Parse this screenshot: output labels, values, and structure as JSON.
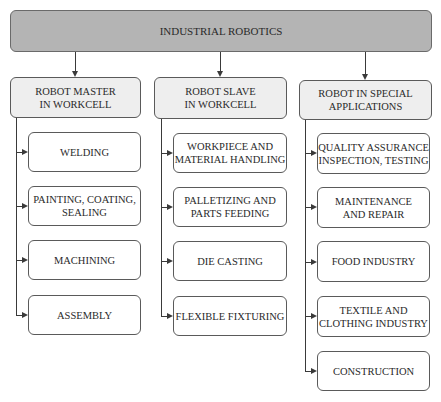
{
  "root": {
    "label": "INDUSTRIAL ROBOTICS"
  },
  "categories": [
    {
      "label": "ROBOT MASTER\nIN WORKCELL",
      "children": [
        {
          "label": "WELDING"
        },
        {
          "label": "PAINTING, COATING,\nSEALING"
        },
        {
          "label": "MACHINING"
        },
        {
          "label": "ASSEMBLY"
        }
      ]
    },
    {
      "label": "ROBOT SLAVE\nIN WORKCELL",
      "children": [
        {
          "label": "WORKPIECE AND\nMATERIAL HANDLING"
        },
        {
          "label": "PALLETIZING AND\nPARTS FEEDING"
        },
        {
          "label": "DIE CASTING"
        },
        {
          "label": "FLEXIBLE FIXTURING"
        }
      ]
    },
    {
      "label": "ROBOT IN SPECIAL\nAPPLICATIONS",
      "children": [
        {
          "label": "QUALITY ASSURANCE\nINSPECTION, TESTING"
        },
        {
          "label": "MAINTENANCE\nAND REPAIR"
        },
        {
          "label": "FOOD INDUSTRY"
        },
        {
          "label": "TEXTILE AND\nCLOTHING INDUSTRY"
        },
        {
          "label": "CONSTRUCTION"
        }
      ]
    }
  ],
  "colors": {
    "root_fill": "#b4b4b4",
    "category_fill": "#eeeeee",
    "leaf_fill": "#ffffff",
    "stroke": "#3a3a3a"
  }
}
